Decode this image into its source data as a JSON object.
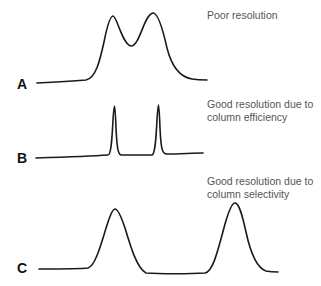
{
  "panels": [
    {
      "label": "A",
      "caption_lines": [
        "Poor resolution"
      ],
      "description": "Two broad, overlapping peaks"
    },
    {
      "label": "B",
      "caption_lines": [
        "Good resolution due to",
        "column efficiency"
      ],
      "description": "Two narrow, sharp peaks close together"
    },
    {
      "label": "C",
      "caption_lines": [
        "Good resolution due to",
        "column selectivity"
      ],
      "description": "Two broad peaks widely separated"
    }
  ],
  "colors": {
    "line": "#1a1a1a",
    "caption": "#555555",
    "label": "#111111"
  }
}
